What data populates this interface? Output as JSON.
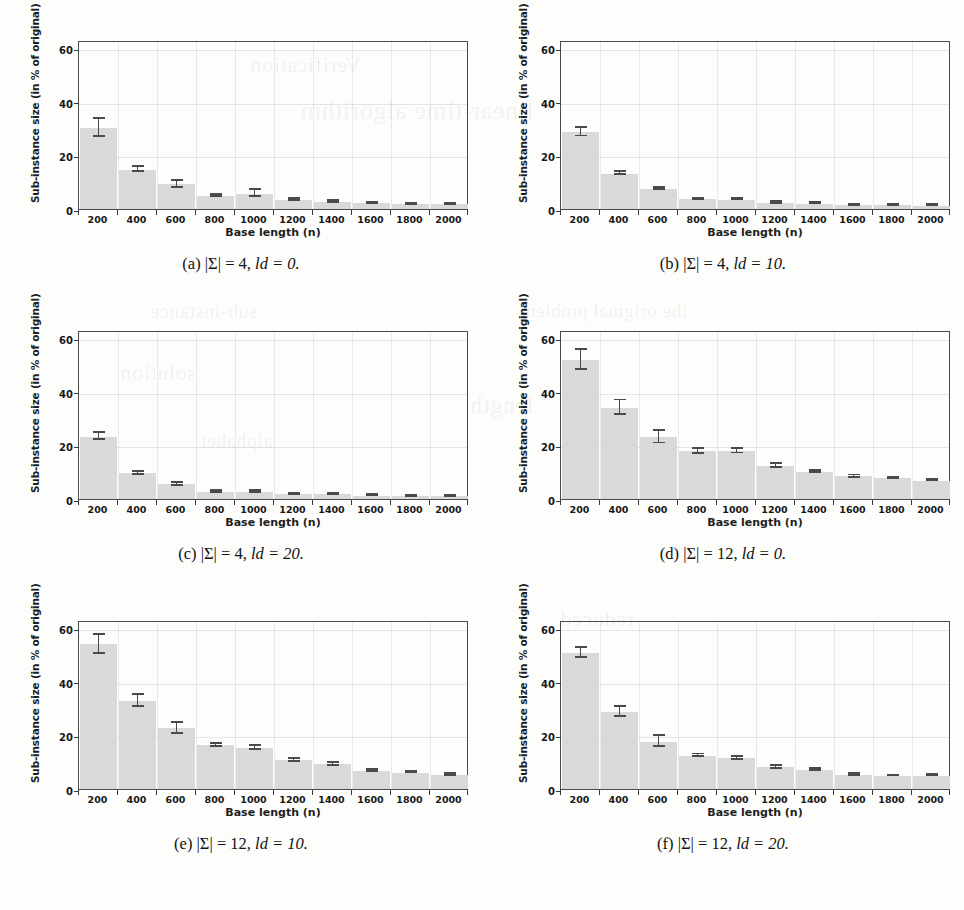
{
  "page": {
    "axis_labels": {
      "y": "Sub-instance size (in % of original)",
      "x": "Base length (n)"
    },
    "y_ticks": [
      "0",
      "20",
      "40",
      "60"
    ],
    "x_ticks": [
      "200",
      "400",
      "600",
      "800",
      "1000",
      "1200",
      "1400",
      "1600",
      "1800",
      "2000"
    ],
    "bar_color": "#d9d9d9",
    "error_bar_color": "#4a4a4a",
    "frame_color": "#4b4b4b"
  },
  "bleed_text": [
    "Verification",
    "linear-time algorithm",
    "sub-instance",
    "the original problem",
    "solution",
    "length",
    "alphabet",
    "reduced"
  ],
  "figures": [
    {
      "id": "a",
      "caption_label": "(a)",
      "caption_alphabet": "|Σ| = 4,",
      "caption_ld": "ld = 0.",
      "caption_full": "(a) |Σ| = 4, ld = 0."
    },
    {
      "id": "b",
      "caption_label": "(b)",
      "caption_alphabet": "|Σ| = 4,",
      "caption_ld": "ld = 10.",
      "caption_full": "(b) |Σ| = 4, ld = 10."
    },
    {
      "id": "c",
      "caption_label": "(c)",
      "caption_alphabet": "|Σ| = 4,",
      "caption_ld": "ld = 20.",
      "caption_full": "(c) |Σ| = 4, ld = 20."
    },
    {
      "id": "d",
      "caption_label": "(d)",
      "caption_alphabet": "|Σ| = 12,",
      "caption_ld": "ld = 0.",
      "caption_full": "(d) |Σ| = 12, ld = 0."
    },
    {
      "id": "e",
      "caption_label": "(e)",
      "caption_alphabet": "|Σ| = 12,",
      "caption_ld": "ld = 10.",
      "caption_full": "(e) |Σ| = 12, ld = 10."
    },
    {
      "id": "f",
      "caption_label": "(f)",
      "caption_alphabet": "|Σ| = 12,",
      "caption_ld": "ld = 20.",
      "caption_full": "(f) |Σ| = 12, ld = 20."
    }
  ],
  "chart_data": [
    {
      "type": "bar",
      "panel": "a",
      "title": "(a) |Σ| = 4, ld = 0.",
      "xlabel": "Base length (n)",
      "ylabel": "Sub-instance size (in % of original)",
      "categories": [
        "200",
        "400",
        "600",
        "800",
        "1000",
        "1200",
        "1400",
        "1600",
        "1800",
        "2000"
      ],
      "values": [
        30.3,
        14.7,
        9.2,
        4.9,
        5.7,
        3.4,
        2.6,
        2.2,
        1.8,
        1.8
      ],
      "errors": [
        3.3,
        0.9,
        1.2,
        0.4,
        1.3,
        0.5,
        0.3,
        0.2,
        0.2,
        0.2
      ],
      "ylim": [
        0,
        63
      ],
      "yticks": [
        0,
        20,
        40,
        60
      ],
      "grid": true,
      "legend": "none"
    },
    {
      "type": "bar",
      "panel": "b",
      "title": "(b) |Σ| = 4, ld = 10.",
      "xlabel": "Base length (n)",
      "ylabel": "Sub-instance size (in % of original)",
      "categories": [
        "200",
        "400",
        "600",
        "800",
        "1000",
        "1200",
        "1400",
        "1600",
        "1800",
        "2000"
      ],
      "values": [
        28.7,
        13.2,
        7.5,
        3.6,
        3.5,
        2.3,
        2.0,
        1.5,
        1.4,
        1.2
      ],
      "errors": [
        1.6,
        0.5,
        0.5,
        0.3,
        0.3,
        0.3,
        0.2,
        0.2,
        0.2,
        0.2
      ],
      "ylim": [
        0,
        63
      ],
      "yticks": [
        0,
        20,
        40,
        60
      ],
      "grid": true,
      "legend": "none"
    },
    {
      "type": "bar",
      "panel": "c",
      "title": "(c) |Σ| = 4, ld = 20.",
      "xlabel": "Base length (n)",
      "ylabel": "Sub-instance size (in % of original)",
      "categories": [
        "200",
        "400",
        "600",
        "800",
        "1000",
        "1200",
        "1400",
        "1600",
        "1800",
        "2000"
      ],
      "values": [
        23.3,
        9.6,
        5.5,
        2.6,
        2.7,
        1.8,
        1.8,
        1.2,
        1.1,
        1.1
      ],
      "errors": [
        1.2,
        0.5,
        0.5,
        0.3,
        0.3,
        0.2,
        0.2,
        0.2,
        0.2,
        0.2
      ],
      "ylim": [
        0,
        63
      ],
      "yticks": [
        0,
        20,
        40,
        60
      ],
      "grid": true,
      "legend": "none"
    },
    {
      "type": "bar",
      "panel": "d",
      "title": "(d) |Σ| = 12, ld = 0.",
      "xlabel": "Base length (n)",
      "ylabel": "Sub-instance size (in % of original)",
      "categories": [
        "200",
        "400",
        "600",
        "800",
        "1000",
        "1200",
        "1400",
        "1600",
        "1800",
        "2000"
      ],
      "values": [
        51.8,
        34.1,
        23.1,
        17.8,
        17.9,
        12.3,
        10.1,
        8.4,
        7.7,
        6.9
      ],
      "errors": [
        3.7,
        2.7,
        2.4,
        0.9,
        0.9,
        0.7,
        0.5,
        0.4,
        0.3,
        0.3
      ],
      "ylim": [
        0,
        63
      ],
      "yticks": [
        0,
        20,
        40,
        60
      ],
      "grid": true,
      "legend": "none"
    },
    {
      "type": "bar",
      "panel": "e",
      "title": "(e) |Σ| = 12, ld = 10.",
      "xlabel": "Base length (n)",
      "ylabel": "Sub-instance size (in % of original)",
      "categories": [
        "200",
        "400",
        "600",
        "800",
        "1000",
        "1200",
        "1400",
        "1600",
        "1800",
        "2000"
      ],
      "values": [
        53.9,
        32.9,
        22.6,
        16.3,
        15.3,
        10.7,
        9.2,
        6.8,
        6.1,
        5.3
      ],
      "errors": [
        3.5,
        2.3,
        2.0,
        0.5,
        0.7,
        0.5,
        0.6,
        0.4,
        0.3,
        0.3
      ],
      "ylim": [
        0,
        63
      ],
      "yticks": [
        0,
        20,
        40,
        60
      ],
      "grid": true,
      "legend": "none"
    },
    {
      "type": "bar",
      "panel": "f",
      "title": "(f) |Σ| = 12, ld = 20.",
      "xlabel": "Base length (n)",
      "ylabel": "Sub-instance size (in % of original)",
      "categories": [
        "200",
        "400",
        "600",
        "800",
        "1000",
        "1200",
        "1400",
        "1600",
        "1800",
        "2000"
      ],
      "values": [
        50.8,
        28.8,
        17.7,
        12.4,
        11.5,
        8.1,
        7.1,
        5.2,
        4.9,
        5.0
      ],
      "errors": [
        1.9,
        1.9,
        2.0,
        0.5,
        0.6,
        0.6,
        0.4,
        0.3,
        0.2,
        0.3
      ],
      "ylim": [
        0,
        63
      ],
      "yticks": [
        0,
        20,
        40,
        60
      ],
      "grid": true,
      "legend": "none"
    }
  ]
}
